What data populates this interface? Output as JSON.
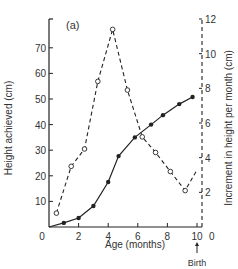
{
  "chart_data": {
    "type": "line",
    "panel_label": "(a)",
    "title": "",
    "xlabel": "Age (months)",
    "ylabel": "Height achieved (cm)",
    "y2label": "Increment in height per month (cm)",
    "xlim": [
      0,
      10
    ],
    "ylim": [
      0,
      80
    ],
    "y2lim": [
      0,
      12
    ],
    "x_ticks": [
      0,
      2,
      4,
      6,
      8,
      10
    ],
    "x_tick_labels": [
      "0",
      "2",
      "4",
      "6",
      "8",
      "10"
    ],
    "y_ticks": [
      10,
      20,
      30,
      40,
      50,
      60,
      70
    ],
    "y_tick_labels": [
      "10",
      "20",
      "30",
      "40",
      "50",
      "60",
      "70"
    ],
    "y_origin_label": "0",
    "y2_ticks": [
      2,
      4,
      6,
      8,
      10,
      12
    ],
    "y2_tick_labels": [
      "2",
      "4",
      "6",
      "8",
      "10",
      "12"
    ],
    "y2_origin_label": "0",
    "annotations": [
      {
        "text": "Birth",
        "x": 10,
        "arrow": "up"
      }
    ],
    "grid": false,
    "legend": null,
    "series": [
      {
        "name": "Height achieved",
        "axis": "left",
        "style": "solid line, filled circles",
        "x": [
          1,
          2,
          3,
          4,
          4.7,
          5.8,
          6.9,
          7.7,
          8.8,
          9.7
        ],
        "values": [
          1.6,
          3.5,
          8.2,
          17.6,
          27.7,
          35,
          40,
          43.7,
          48,
          50.8
        ]
      },
      {
        "name": "Increment in height per month",
        "axis": "right",
        "style": "dashed line, open circles",
        "x": [
          0.5,
          1.5,
          2.4,
          3.3,
          4.3,
          5.3,
          6.3,
          7.2,
          8.2,
          9.2
        ],
        "values": [
          0.8,
          3.5,
          4.5,
          8.4,
          11.4,
          7.9,
          5.2,
          4.3,
          3.2,
          2.1
        ],
        "dash_end": {
          "x": 10,
          "value": 3.3
        }
      }
    ]
  }
}
